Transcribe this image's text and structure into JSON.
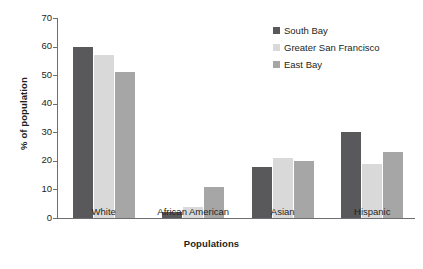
{
  "chart_data": {
    "type": "bar",
    "title": "",
    "xlabel": "Populations",
    "ylabel": "% of population",
    "categories": [
      "White",
      "African American",
      "Asian",
      "Hispanic"
    ],
    "series": [
      {
        "name": "South Bay",
        "color": "#59595b",
        "values": [
          60,
          2,
          18,
          30
        ]
      },
      {
        "name": "Greater San Francisco",
        "color": "#d9d9d9",
        "values": [
          57,
          4,
          21,
          19
        ]
      },
      {
        "name": "East Bay",
        "color": "#a6a6a6",
        "values": [
          51,
          11,
          20,
          23
        ]
      }
    ],
    "ylim": [
      0,
      70
    ],
    "yticks": [
      0,
      10,
      20,
      30,
      40,
      50,
      60,
      70
    ],
    "ytick_labels": [
      "0",
      "10",
      "20",
      "30",
      "40",
      "50",
      "60",
      "70"
    ],
    "grid": false,
    "legend_position": "top-right",
    "axis_color": "#6d6e71",
    "text_color": "#231f20",
    "background": "#ffffff"
  }
}
